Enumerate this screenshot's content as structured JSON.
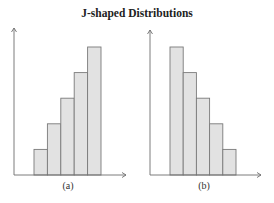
{
  "title": "J-shaped Distributions",
  "colors": {
    "bar_fill": "#e2e2e2",
    "bar_stroke": "#7a7a7a",
    "axis": "#6e6e6e"
  },
  "chart_data": [
    {
      "type": "bar",
      "title": "J-shaped Distributions",
      "label": "(a)",
      "categories": [
        "1",
        "2",
        "3",
        "4",
        "5"
      ],
      "values": [
        1,
        2,
        3,
        4,
        5
      ],
      "xlabel": "",
      "ylabel": "",
      "grid": false,
      "axis_ticks": false
    },
    {
      "type": "bar",
      "title": "J-shaped Distributions",
      "label": "(b)",
      "categories": [
        "1",
        "2",
        "3",
        "4",
        "5"
      ],
      "values": [
        5,
        4,
        3,
        2,
        1
      ],
      "xlabel": "",
      "ylabel": "",
      "grid": false,
      "axis_ticks": false
    }
  ]
}
